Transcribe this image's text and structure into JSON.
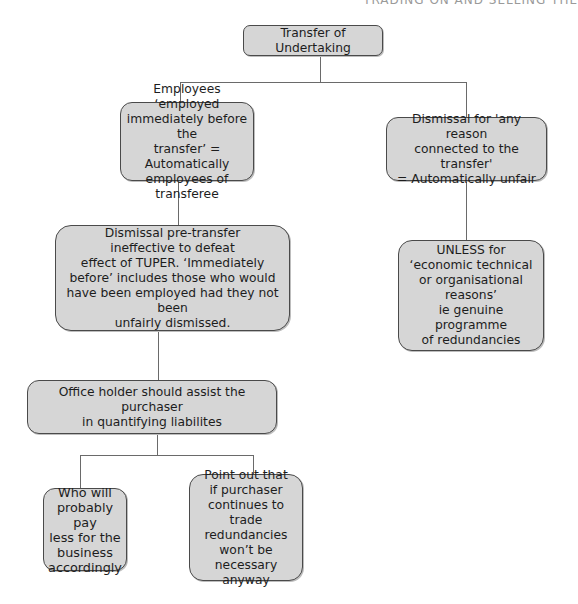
{
  "running_header": "TRADING ON AND SELLING THE",
  "diagram": {
    "root": {
      "label": "Transfer of Undertaking"
    },
    "left_branch": {
      "employees_box": "Employees ‘employed\nimmediately before the\ntransfer’ = Automatically\nemployees of transferee",
      "pre_transfer_box": "Dismissal pre-transfer\nineffective to defeat\neffect of TUPER. ‘Immediately\nbefore’ includes those who would\nhave been employed had they not been\nunfairly dismissed.",
      "office_holder_box": "Office holder should assist the purchaser\nin quantifying liabilites",
      "children": [
        {
          "label": "Who will\nprobably pay\nless for the\nbusiness\naccordingly"
        },
        {
          "label": "Point out that\nif purchaser\ncontinues to\ntrade redundancies\nwon’t be necessary\nanyway"
        }
      ]
    },
    "right_branch": {
      "dismissal_box": "Dismissal for 'any reason\nconnected to the transfer'\n= Automatically unfair",
      "unless_box": "UNLESS for\n‘economic technical\nor organisational\nreasons’\nie genuine programme\nof redundancies"
    }
  },
  "colors": {
    "box_fill": "#d6d6d6",
    "box_border": "#4a4a4a",
    "connector": "#6a6a6a"
  }
}
